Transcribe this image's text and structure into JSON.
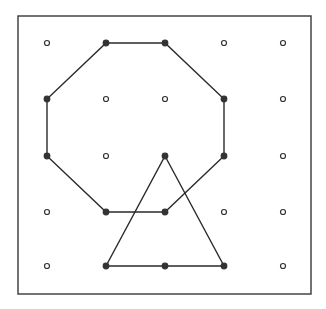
{
  "diagram": {
    "type": "geoboard",
    "grid": {
      "columns": 5,
      "rows": 5,
      "x_positions": [
        47,
        106,
        165,
        224,
        283
      ],
      "y_positions": [
        43,
        99,
        156,
        212,
        266
      ]
    },
    "frame": {
      "x": 18,
      "y": 16,
      "width": 293,
      "height": 278
    },
    "shapes": [
      {
        "name": "octagon",
        "vertices_grid": [
          [
            1,
            0
          ],
          [
            2,
            0
          ],
          [
            3,
            1
          ],
          [
            3,
            2
          ],
          [
            2,
            3
          ],
          [
            1,
            3
          ],
          [
            0,
            2
          ],
          [
            0,
            1
          ]
        ]
      },
      {
        "name": "triangle",
        "vertices_grid": [
          [
            2,
            2
          ],
          [
            3,
            4
          ],
          [
            1,
            4
          ]
        ]
      }
    ],
    "colors": {
      "line": "#2a2a2a",
      "peg": "#333333",
      "background": "#ffffff"
    }
  }
}
